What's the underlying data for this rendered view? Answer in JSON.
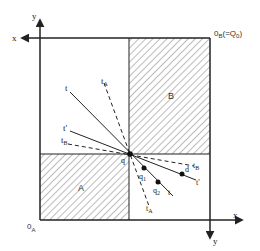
{
  "figure": {
    "type": "edgeworth-box",
    "colors": {
      "line": "#222222",
      "hatch": "#555555",
      "background": "#ffffff"
    },
    "origins": {
      "a": {
        "label": "0",
        "subscript": "A"
      },
      "b": {
        "label": "0",
        "subscript": "B",
        "suffix": "(=Q",
        "suffix_sub": "0",
        "suffix_end": ")"
      }
    },
    "axes": {
      "a_x": "x",
      "a_y": "y",
      "b_x": "x",
      "b_y": "y"
    },
    "regions": {
      "a": "A",
      "b": "B"
    },
    "points": {
      "q": "q",
      "q1": {
        "label": "q",
        "subscript": "1"
      },
      "q2": {
        "label": "q",
        "subscript": "2"
      },
      "d": "d"
    },
    "lines": {
      "t_upper": "t",
      "t_lower": "t",
      "t_prime_upper": "t'",
      "t_prime_lower": "t'",
      "tA_upper": {
        "label": "t",
        "subscript": "A"
      },
      "tA_lower": {
        "label": "t",
        "subscript": "A"
      },
      "tB_upper": {
        "label": "t",
        "subscript": "B"
      },
      "tB_lower": {
        "label": "t",
        "subscript": "B"
      }
    }
  }
}
